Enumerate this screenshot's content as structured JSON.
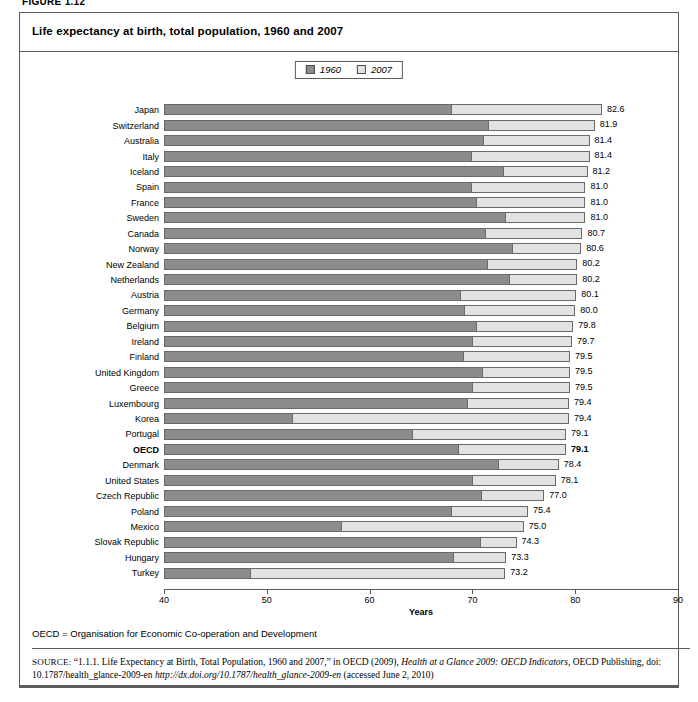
{
  "figure_label": "FIGURE 1.12",
  "title": "Life expectancy at birth, total population, 1960 and 2007",
  "legend": {
    "items": [
      {
        "label": "1960",
        "color": "#8c8c8c"
      },
      {
        "label": "2007",
        "color": "#e2e2e2"
      }
    ]
  },
  "notes": {
    "abbreviation": "OECD = Organisation for Economic Co-operation and Development",
    "source_prefix": "SOURCE:",
    "source_part1": " “1.1.1. Life Expectancy at Birth, Total Population, 1960 and 2007,” in OECD (2009), ",
    "source_italic1": "Health at a Glance 2009: OECD Indicators",
    "source_part2": ", OECD Publishing, doi: 10.1787/health_glance-2009-en ",
    "source_italic2": "http://dx.doi.org/10.1787/health_glance-2009-en",
    "source_part3": " (accessed June 2, 2010)"
  },
  "chart_data": {
    "type": "bar",
    "orientation": "horizontal",
    "stacked": true,
    "title": "Life expectancy at birth, total population, 1960 and 2007",
    "xlabel": "Years",
    "ylabel": "",
    "xlim": [
      40,
      90
    ],
    "xticks": [
      40,
      50,
      60,
      70,
      80,
      90
    ],
    "grid": false,
    "legend_position": "top-center",
    "highlight_category": "OECD",
    "categories": [
      "Japan",
      "Switzerland",
      "Australia",
      "Italy",
      "Iceland",
      "Spain",
      "France",
      "Sweden",
      "Canada",
      "Norway",
      "New Zealand",
      "Netherlands",
      "Austria",
      "Germany",
      "Belgium",
      "Ireland",
      "Finland",
      "United Kingdom",
      "Greece",
      "Luxembourg",
      "Korea",
      "Portugal",
      "OECD",
      "Denmark",
      "United States",
      "Czech Republic",
      "Poland",
      "Mexico",
      "Slovak Republic",
      "Hungary",
      "Turkey"
    ],
    "series": [
      {
        "name": "1960",
        "color": "#8c8c8c",
        "values": [
          67.8,
          71.4,
          70.9,
          69.8,
          72.9,
          69.8,
          70.3,
          73.1,
          71.1,
          73.8,
          71.3,
          73.5,
          68.7,
          69.1,
          70.3,
          69.9,
          69.0,
          70.8,
          69.9,
          69.4,
          52.4,
          64.0,
          68.5,
          72.4,
          69.9,
          70.7,
          67.8,
          57.1,
          70.6,
          68.0,
          48.3
        ]
      },
      {
        "name": "2007",
        "color": "#e2e2e2",
        "values": [
          82.6,
          81.9,
          81.4,
          81.4,
          81.2,
          81.0,
          81.0,
          81.0,
          80.7,
          80.6,
          80.2,
          80.2,
          80.1,
          80.0,
          79.8,
          79.7,
          79.5,
          79.5,
          79.5,
          79.4,
          79.4,
          79.1,
          79.1,
          78.4,
          78.1,
          77.0,
          75.4,
          75.0,
          74.3,
          73.3,
          73.2
        ]
      }
    ],
    "value_labels": [
      "82.6",
      "81.9",
      "81.4",
      "81.4",
      "81.2",
      "81.0",
      "81.0",
      "81.0",
      "80.7",
      "80.6",
      "80.2",
      "80.2",
      "80.1",
      "80.0",
      "79.8",
      "79.7",
      "79.5",
      "79.5",
      "79.5",
      "79.4",
      "79.4",
      "79.1",
      "79.1",
      "78.4",
      "78.1",
      "77.0",
      "75.4",
      "75.0",
      "74.3",
      "73.3",
      "73.2"
    ]
  }
}
